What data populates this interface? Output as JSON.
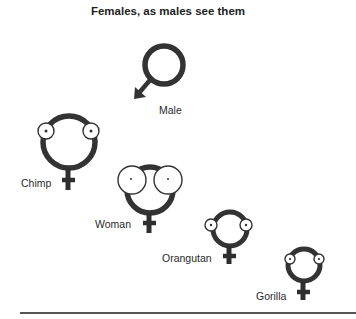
{
  "title": "Females, as males see them",
  "figures": [
    {
      "id": "male",
      "label": "Male",
      "symbol": "male",
      "eye_size": "none"
    },
    {
      "id": "chimp",
      "label": "Chimp",
      "symbol": "female",
      "eye_size": "small"
    },
    {
      "id": "woman",
      "label": "Woman",
      "symbol": "female",
      "eye_size": "large"
    },
    {
      "id": "orangutan",
      "label": "Orangutan",
      "symbol": "female",
      "eye_size": "small"
    },
    {
      "id": "gorilla",
      "label": "Gorilla",
      "symbol": "female",
      "eye_size": "small"
    }
  ],
  "colors": {
    "stroke": "#333333",
    "background": "#ffffff"
  }
}
